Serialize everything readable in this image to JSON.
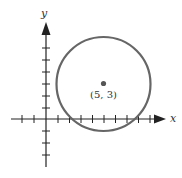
{
  "diagram": {
    "x_axis_label": "x",
    "y_axis_label": "y",
    "center_label": "(5, 3)",
    "center": {
      "x": 5,
      "y": 3
    },
    "colors": {
      "circle": "#666666",
      "axes": "#222222",
      "point": "#555555"
    }
  }
}
